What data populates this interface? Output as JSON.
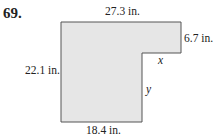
{
  "problem_number": "69.",
  "figure": {
    "shape": "L-shaped polygon",
    "fill_color": "#e6e6e6",
    "stroke_color": "#555555",
    "labels": {
      "top": "27.3 in.",
      "right_short": "6.7 in.",
      "left": "22.1 in.",
      "bottom": "18.4 in.",
      "inner_horizontal": "x",
      "inner_vertical": "y"
    }
  }
}
